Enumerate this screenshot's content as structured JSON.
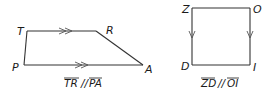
{
  "figures": [
    {
      "id": "trapezoid",
      "name": "TRAP",
      "vertices": {
        "T": {
          "label": "T",
          "x": 27,
          "y": 31
        },
        "R": {
          "label": "R",
          "x": 96,
          "y": 31
        },
        "A": {
          "label": "A",
          "x": 143,
          "y": 65
        },
        "P": {
          "label": "P",
          "x": 24,
          "y": 65
        }
      },
      "parallel_marks": "double-arrow",
      "caption": {
        "segment1": "TR",
        "relation": "//",
        "segment2": "PA"
      }
    },
    {
      "id": "rectangle",
      "name": "ZOID",
      "vertices": {
        "Z": {
          "label": "Z",
          "x": 192,
          "y": 8
        },
        "O": {
          "label": "O",
          "x": 250,
          "y": 8
        },
        "I": {
          "label": "I",
          "x": 250,
          "y": 65
        },
        "D": {
          "label": "D",
          "x": 192,
          "y": 65
        }
      },
      "parallel_marks": "single-arrow",
      "caption": {
        "segment1": "ZD",
        "relation": "//",
        "segment2": "OI"
      }
    }
  ],
  "colors": {
    "line": "#333333",
    "text": "#1a1a1a",
    "background": "#ffffff"
  }
}
